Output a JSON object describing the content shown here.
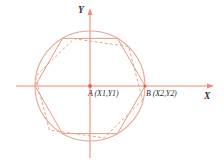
{
  "figure": {
    "type": "geometry-diagram",
    "background_color": "#ffffff",
    "axis_color": "#f08a7a",
    "circle_color": "#e8a68f",
    "hexagon_solid_color": "#e89a85",
    "hexagon_dashed_color": "#d9a894",
    "vertex_color": "#e8604a"
  },
  "axes": {
    "x_label": "X",
    "y_label": "Y",
    "origin_x": 90,
    "origin_y": 86
  },
  "points": [
    {
      "id": "A",
      "name": "A",
      "coords": "(X1,Y1)",
      "label": "A (X1,Y1)",
      "role": "circle-center",
      "cx": 90,
      "cy": 86
    },
    {
      "id": "B",
      "name": "B",
      "coords": "(X2,Y2)",
      "label": "B (X2,Y2)",
      "role": "circle-edge-right",
      "cx": 146,
      "cy": 86
    }
  ],
  "circle": {
    "center_x": 90,
    "center_y": 86,
    "radius": 55
  },
  "hexagons": [
    {
      "id": "solid",
      "style": "solid",
      "inscribed_in": "circle",
      "orientation": "flat-top"
    },
    {
      "id": "dashed",
      "style": "dashed",
      "inscribed_in": "circle",
      "orientation": "flat-top-rotated"
    }
  ]
}
